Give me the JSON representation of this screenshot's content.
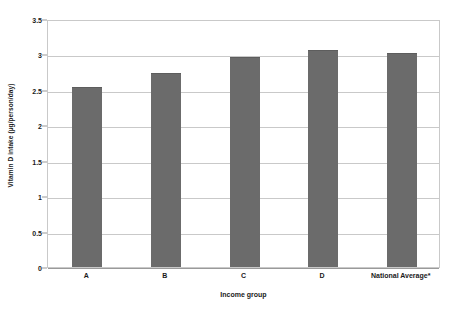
{
  "chart_data": {
    "type": "bar",
    "title": "",
    "subtitle": "",
    "xlabel": "Income group",
    "ylabel": "Vitamin D intake (µg/person/day)",
    "categories": [
      "A",
      "B",
      "C",
      "D",
      "National Average*"
    ],
    "values": [
      2.54,
      2.74,
      2.97,
      3.06,
      3.02
    ],
    "series": [
      {
        "name": "Vitamin D intake",
        "values": [
          2.54,
          2.74,
          2.97,
          3.06,
          3.02
        ]
      }
    ],
    "ylim": [
      0,
      3.5
    ],
    "y_ticks": [
      0,
      0.5,
      1,
      1.5,
      2,
      2.5,
      3,
      3.5
    ],
    "y_tick_labels": [
      "0",
      "0.5",
      "1",
      "1.5",
      "2",
      "2.5",
      "3",
      "3.5"
    ],
    "grid": true,
    "grid_axis": "y",
    "legend": false,
    "legend_position": "none",
    "annotations": [],
    "colors": {
      "bar_fill": "#6b6b6b",
      "bar_edge": "#5d5d5d",
      "gridline": "#c9c9c9",
      "axis_line": "#9a9a9a",
      "frame": "#c9c9c9",
      "text": "#1a1a1a",
      "background": "#ffffff"
    }
  }
}
